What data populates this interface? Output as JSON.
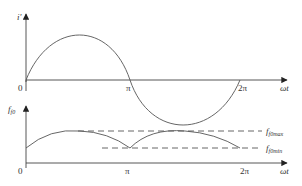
{
  "diagram": {
    "top_plot": {
      "y_label": "i'",
      "x_label": "ωt",
      "origin_label": "0",
      "ticks": [
        "π",
        "2π"
      ],
      "curve": "sine",
      "colors": {
        "line": "#555555"
      }
    },
    "bottom_plot": {
      "y_label_main": "f",
      "y_label_sub": "f0",
      "x_label": "ωt",
      "origin_label": "0",
      "ticks": [
        "π",
        "2π"
      ],
      "levels": [
        {
          "main": "f",
          "sub": "f0max",
          "style": "dashed"
        },
        {
          "main": "f",
          "sub": "f0min",
          "style": "dashed"
        }
      ],
      "curve": "rectified-sine-arcs",
      "colors": {
        "line": "#555555"
      }
    }
  }
}
